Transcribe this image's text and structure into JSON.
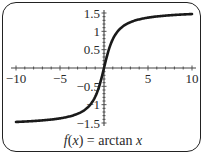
{
  "chart_data": {
    "type": "line",
    "title": "",
    "caption_parts": {
      "f": "f",
      "open": "(",
      "x": "x",
      "close": ")",
      "eq": " = arctan ",
      "x2": "x"
    },
    "caption": "f(x) = arctan x",
    "xlabel": "",
    "ylabel": "",
    "xlim": [
      -10,
      10
    ],
    "ylim": [
      -1.5,
      1.5
    ],
    "x_ticks": [
      -10,
      -5,
      5,
      10
    ],
    "x_tick_labels": [
      "−10",
      "−5",
      "5",
      "10"
    ],
    "y_ticks": [
      1.5,
      1,
      0.5,
      -0.5,
      -1,
      -1.5
    ],
    "y_tick_labels": [
      "1.5",
      "1",
      "0.5",
      "−0.5",
      "−1",
      "−1.5"
    ],
    "minor_tick_step": 1,
    "y_minor_tick_step": 0.1,
    "grid": false,
    "series": [
      {
        "name": "arctan x",
        "function": "arctan",
        "x_range": [
          -10,
          10
        ],
        "sample_points": [
          [
            -10,
            -1.471
          ],
          [
            -8,
            -1.446
          ],
          [
            -6,
            -1.406
          ],
          [
            -4,
            -1.326
          ],
          [
            -3,
            -1.249
          ],
          [
            -2,
            -1.107
          ],
          [
            -1,
            -0.785
          ],
          [
            -0.5,
            -0.464
          ],
          [
            0,
            0
          ],
          [
            0.5,
            0.464
          ],
          [
            1,
            0.785
          ],
          [
            2,
            1.107
          ],
          [
            3,
            1.249
          ],
          [
            4,
            1.326
          ],
          [
            6,
            1.406
          ],
          [
            8,
            1.446
          ],
          [
            10,
            1.471
          ]
        ],
        "color": "#1a1a1a"
      }
    ]
  }
}
